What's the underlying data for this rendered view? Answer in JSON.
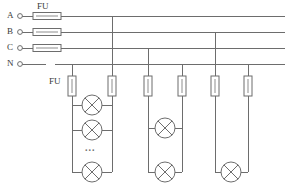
{
  "diagram": {
    "type": "electrical-schematic",
    "width": 294,
    "height": 190,
    "background_color": "#ffffff",
    "line_color": "#6d6d6d",
    "text_color": "#3a3a3a"
  },
  "bus_lines": [
    {
      "id": "A",
      "label": "A",
      "label_x": 8,
      "label_y": 12,
      "y": 16,
      "terminal_x": 20,
      "x_start": 20,
      "x_end": 285,
      "has_fuse": true,
      "fuse_x": 33,
      "fuse_width": 28,
      "fuse_label": "FU"
    },
    {
      "id": "B",
      "label": "B",
      "label_x": 8,
      "label_y": 28,
      "y": 32,
      "terminal_x": 20,
      "x_start": 20,
      "x_end": 285,
      "has_fuse": true,
      "fuse_x": 33,
      "fuse_width": 28,
      "fuse_label": ""
    },
    {
      "id": "C",
      "label": "C",
      "label_x": 8,
      "label_y": 44,
      "y": 48,
      "terminal_x": 20,
      "x_start": 20,
      "x_end": 285,
      "has_fuse": true,
      "fuse_x": 33,
      "fuse_width": 28,
      "fuse_label": ""
    },
    {
      "id": "N",
      "label": "N",
      "label_x": 8,
      "label_y": 60,
      "y": 64,
      "terminal_x": 20,
      "x_start": 20,
      "x_end": 285,
      "has_fuse": false,
      "gap_start": 46,
      "gap_end": 55,
      "fuse_label": ""
    }
  ],
  "top_fuse_label": {
    "text": "FU",
    "x": 33,
    "y": 4
  },
  "branch_fuse_label": {
    "text": "FU",
    "x": 49,
    "y": 76
  },
  "branch_taps": [
    {
      "id": "tap-1",
      "phase": "A",
      "x": 112,
      "from_y": 16,
      "to_y": 76
    },
    {
      "id": "tap-2",
      "phase": "N",
      "x": 72,
      "from_y": 64,
      "to_y": 76
    },
    {
      "id": "tap-3",
      "phase": "C",
      "x": 148,
      "from_y": 48,
      "to_y": 76
    },
    {
      "id": "tap-4",
      "phase": "N",
      "x": 182,
      "from_y": 64,
      "to_y": 76
    },
    {
      "id": "tap-5",
      "phase": "B",
      "x": 215,
      "from_y": 32,
      "to_y": 76
    },
    {
      "id": "tap-6",
      "phase": "N",
      "x": 248,
      "from_y": 64,
      "to_y": 76
    }
  ],
  "branch_fuses": [
    {
      "id": "branch-fuse-1",
      "x": 72,
      "y": 76,
      "width": 8,
      "height": 20
    },
    {
      "id": "branch-fuse-2",
      "x": 112,
      "y": 76,
      "width": 8,
      "height": 20
    },
    {
      "id": "branch-fuse-3",
      "x": 148,
      "y": 76,
      "width": 8,
      "height": 20
    },
    {
      "id": "branch-fuse-4",
      "x": 182,
      "y": 76,
      "width": 8,
      "height": 20
    },
    {
      "id": "branch-fuse-5",
      "x": 215,
      "y": 76,
      "width": 8,
      "height": 20
    },
    {
      "id": "branch-fuse-6",
      "x": 248,
      "y": 76,
      "width": 8,
      "height": 20
    }
  ],
  "lamp_groups": [
    {
      "id": "lamp-group-left",
      "left_rail_x": 72,
      "right_rail_x": 112,
      "rail_top_y": 96,
      "rail_bottom_y": 172,
      "lamp_count_shown": 3,
      "lamp_radius": 10,
      "lamps": [
        {
          "id": "lamp-L1",
          "cx": 92,
          "cy": 105
        },
        {
          "id": "lamp-L2",
          "cx": 92,
          "cy": 130
        },
        {
          "id": "lamp-L3",
          "cx": 92,
          "cy": 172
        }
      ],
      "ellipsis": {
        "text": "...",
        "x": 85,
        "y": 148
      }
    },
    {
      "id": "lamp-group-middle",
      "left_rail_x": 148,
      "right_rail_x": 182,
      "rail_top_y": 96,
      "rail_bottom_y": 172,
      "lamp_count_shown": 2,
      "lamp_radius": 10,
      "lamps": [
        {
          "id": "lamp-M1",
          "cx": 165,
          "cy": 128
        },
        {
          "id": "lamp-M2",
          "cx": 165,
          "cy": 172
        }
      ],
      "ellipsis": null
    },
    {
      "id": "lamp-group-right",
      "left_rail_x": 215,
      "right_rail_x": 248,
      "rail_top_y": 96,
      "rail_bottom_y": 172,
      "lamp_count_shown": 1,
      "lamp_radius": 10,
      "lamps": [
        {
          "id": "lamp-R1",
          "cx": 231,
          "cy": 172
        }
      ],
      "ellipsis": null
    }
  ]
}
